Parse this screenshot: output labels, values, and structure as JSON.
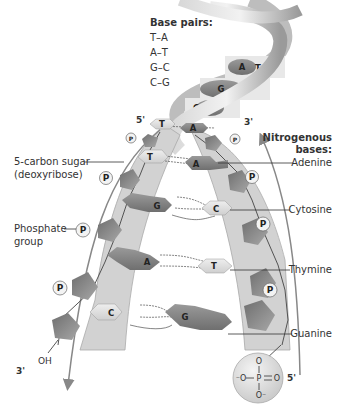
{
  "base_pairs": {
    "title": "Base pairs:",
    "items": [
      "T–A",
      "A–T",
      "G–C",
      "C–G"
    ]
  },
  "helix_top": {
    "rungs": [
      {
        "left": "A",
        "right": "T"
      },
      {
        "left": "G",
        "right": "C"
      },
      {
        "left": "C",
        "right": ""
      }
    ]
  },
  "strands": {
    "left_top_end": "5'",
    "left_bottom_end": "3'",
    "right_top_end": "3'",
    "right_bottom_end": "5'",
    "oh_label": "OH"
  },
  "ladder": {
    "rungs": [
      {
        "left": "T",
        "right": "A"
      },
      {
        "left": "T",
        "right": "A"
      },
      {
        "left": "G",
        "right": "C"
      },
      {
        "left": "A",
        "right": "T"
      },
      {
        "left": "C",
        "right": "G"
      }
    ],
    "phosphate_symbol": "P"
  },
  "labels_left": {
    "sugar_line1": "5-carbon sugar",
    "sugar_line2": "(deoxyribose)",
    "phosphate_line1": "Phosphate",
    "phosphate_line2": "group"
  },
  "labels_right": {
    "title_line1": "Nitrogenous",
    "title_line2": "bases:",
    "adenine": "Adenine",
    "cytosine": "Cytosine",
    "thymine": "Thymine",
    "guanine": "Guanine"
  },
  "phosphate_detail": {
    "center": "P",
    "oxygen": "O",
    "top": "O",
    "left": "⁻O",
    "right": "O",
    "bottom": "O⁻"
  },
  "colors": {
    "strand_band": "#cfcfcf",
    "sugar_dark": "#7a7a7a",
    "sugar_light": "#a5a5a5",
    "base_dark": "#8a8a8a",
    "base_light": "#d9d9d9",
    "arrow": "#888888"
  }
}
